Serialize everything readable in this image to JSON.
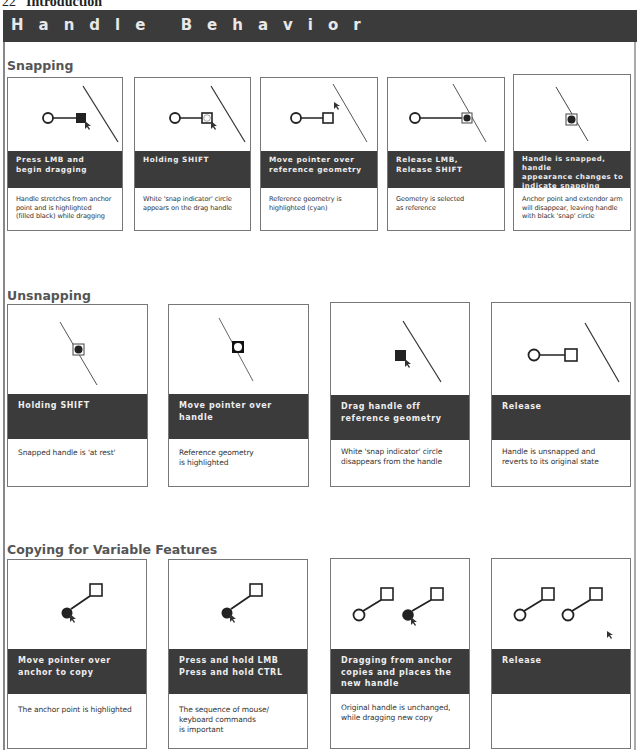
{
  "page_header": {
    "page_number": "22",
    "chapter": "Introduction"
  },
  "title": "Handle Behavior",
  "colors": {
    "bar": "#3b3b3b",
    "bar_text": "#eeeeee",
    "border": "#777777",
    "heading": "#555555"
  },
  "sections": [
    {
      "title": "Snapping",
      "steps": [
        {
          "label": "Press LMB and\nbegin dragging",
          "desc": "Handle stretches from anchor\npoint and is highlighted\n(filled black) while dragging",
          "figure": "handle-filled-drag"
        },
        {
          "label": "Holding SHIFT",
          "desc": "White 'snap indicator' circle\nappears on the drag handle",
          "figure": "handle-snap-indicator"
        },
        {
          "label": "Move pointer over\nreference geometry",
          "desc": "Reference geometry is\nhighlighted (cyan)",
          "figure": "pointer-over-geometry"
        },
        {
          "label": "Release LMB,\nRelease SHIFT",
          "desc": "Geometry is selected\nas reference",
          "figure": "handle-on-geometry"
        },
        {
          "label": "Handle is snapped, handle\nappearance changes to\nindicate snapping",
          "desc": "Anchor point and extendor arm\nwill disappear, leaving handle\nwith black 'snap' circle",
          "figure": "snapped-handle"
        }
      ]
    },
    {
      "title": "Unsnapping",
      "steps": [
        {
          "label": "Holding SHIFT",
          "desc": "Snapped handle is 'at rest'",
          "figure": "snapped-handle"
        },
        {
          "label": "Move pointer over handle",
          "desc": "Reference geometry\nis highlighted",
          "figure": "snapped-handle-hover"
        },
        {
          "label": "Drag handle off\nreference geometry",
          "desc": "White 'snap indicator' circle\ndisappears from the handle",
          "figure": "handle-dragged-off"
        },
        {
          "label": "Release",
          "desc": "Handle is unsnapped and\nreverts to its original state",
          "figure": "handle-original"
        }
      ]
    },
    {
      "title": "Copying for Variable Features",
      "steps": [
        {
          "label": "Move pointer over\nanchor to copy",
          "desc": "The anchor point is highlighted",
          "figure": "anchor-hover"
        },
        {
          "label": "Press and hold LMB\nPress and hold CTRL",
          "desc": "The sequence of mouse/\nkeyboard commands\nis important",
          "figure": "anchor-hover"
        },
        {
          "label": "Dragging from anchor\ncopies and places the\nnew handle",
          "desc": "Original handle is unchanged,\nwhile dragging new copy",
          "figure": "copy-dragging"
        },
        {
          "label": "Release",
          "desc": "",
          "figure": "copy-released"
        }
      ]
    }
  ]
}
